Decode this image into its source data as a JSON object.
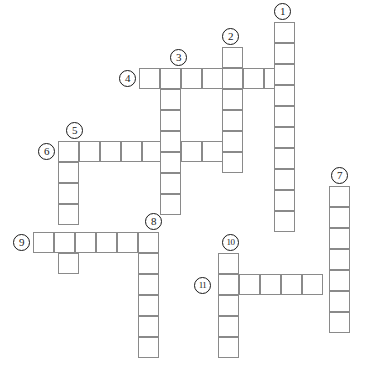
{
  "puzzle": {
    "type": "crossword-grid",
    "title": "",
    "cell_size": 21,
    "grid_origin": {
      "x": 33,
      "y": 22
    },
    "colors": {
      "cell_border": "#8a8a8a",
      "cell_fill": "#ffffff",
      "number_circle_border": "#1a1a1a",
      "number_text": "#1a1a1a",
      "background": "#ffffff"
    },
    "clue_numbers": [
      {
        "label": "1",
        "x": 274,
        "y": 3,
        "direction": "down",
        "length": 10
      },
      {
        "label": "2",
        "x": 222,
        "y": 28,
        "direction": "down",
        "length": 6
      },
      {
        "label": "3",
        "x": 170,
        "y": 49,
        "direction": "down",
        "length": 7
      },
      {
        "label": "4",
        "x": 119,
        "y": 70,
        "direction": "across",
        "length": 8
      },
      {
        "label": "5",
        "x": 66,
        "y": 122,
        "direction": "down",
        "length": 6
      },
      {
        "label": "6",
        "x": 38,
        "y": 143,
        "direction": "across",
        "length": 9
      },
      {
        "label": "7",
        "x": 331,
        "y": 167,
        "direction": "down",
        "length": 7
      },
      {
        "label": "8",
        "x": 145,
        "y": 213,
        "direction": "down",
        "length": 6
      },
      {
        "label": "9",
        "x": 13,
        "y": 234,
        "direction": "across",
        "length": 6
      },
      {
        "label": "10",
        "x": 222,
        "y": 234,
        "direction": "down",
        "length": 6
      },
      {
        "label": "11",
        "x": 194,
        "y": 277,
        "direction": "across",
        "length": 7
      }
    ],
    "entries": [
      {
        "number": "1",
        "direction": "down",
        "start_col": 12,
        "start_row": 0,
        "length": 10
      },
      {
        "number": "2",
        "direction": "down",
        "start_col": 9,
        "start_row": 1,
        "length": 6
      },
      {
        "number": "3",
        "direction": "down",
        "start_col": 7,
        "start_row": 2,
        "length": 7
      },
      {
        "number": "4",
        "direction": "across",
        "start_col": 5,
        "start_row": 2,
        "length": 8
      },
      {
        "number": "5",
        "direction": "down",
        "start_col": 2,
        "start_row": 5,
        "length": 6
      },
      {
        "number": "6",
        "direction": "across",
        "start_col": 2,
        "start_row": 5,
        "length": 9
      },
      {
        "number": "7",
        "direction": "down",
        "start_col": 15,
        "start_row": 7,
        "length": 7
      },
      {
        "number": "8",
        "direction": "down",
        "start_col": 6,
        "start_row": 10,
        "length": 6
      },
      {
        "number": "9",
        "direction": "across",
        "start_col": 1,
        "start_row": 10,
        "length": 6
      },
      {
        "number": "10",
        "direction": "down",
        "start_col": 10,
        "start_row": 11,
        "length": 6
      },
      {
        "number": "11",
        "direction": "across",
        "start_col": 10,
        "start_row": 13,
        "length": 7
      }
    ],
    "cells": [
      {
        "x": 274,
        "y": 22,
        "name": "cell-r0-c12"
      },
      {
        "x": 274,
        "y": 43,
        "name": "cell-r1-c12"
      },
      {
        "x": 222,
        "y": 47,
        "name": "cell-r1-c9"
      },
      {
        "x": 139,
        "y": 68,
        "name": "cell-r2-c5"
      },
      {
        "x": 160,
        "y": 68,
        "name": "cell-r2-c6"
      },
      {
        "x": 181,
        "y": 68,
        "name": "cell-r2-c7"
      },
      {
        "x": 202,
        "y": 68,
        "name": "cell-r2-c8"
      },
      {
        "x": 222,
        "y": 68,
        "name": "cell-r2-c9"
      },
      {
        "x": 243,
        "y": 68,
        "name": "cell-r2-c10"
      },
      {
        "x": 264,
        "y": 68,
        "name": "cell-r2-c11"
      },
      {
        "x": 274,
        "y": 64,
        "name": "cell-r2-c12"
      },
      {
        "x": 274,
        "y": 85,
        "name": "cell-r3-c12"
      },
      {
        "x": 222,
        "y": 89,
        "name": "cell-r3-c9"
      },
      {
        "x": 160,
        "y": 89,
        "name": "cell-r3-c6"
      },
      {
        "x": 274,
        "y": 106,
        "name": "cell-r4-c12"
      },
      {
        "x": 222,
        "y": 110,
        "name": "cell-r4-c9"
      },
      {
        "x": 160,
        "y": 110,
        "name": "cell-r4-c6"
      },
      {
        "x": 58,
        "y": 141,
        "name": "cell-r5-c2"
      },
      {
        "x": 79,
        "y": 141,
        "name": "cell-r5-c3"
      },
      {
        "x": 100,
        "y": 141,
        "name": "cell-r5-c4"
      },
      {
        "x": 121,
        "y": 141,
        "name": "cell-r5-c5"
      },
      {
        "x": 142,
        "y": 141,
        "name": "cell-r5-c6"
      },
      {
        "x": 160,
        "y": 131,
        "name": "cell-r5-c6b"
      },
      {
        "x": 181,
        "y": 141,
        "name": "cell-r5-c7"
      },
      {
        "x": 202,
        "y": 141,
        "name": "cell-r5-c8"
      },
      {
        "x": 222,
        "y": 131,
        "name": "cell-r5-c9"
      },
      {
        "x": 274,
        "y": 127,
        "name": "cell-r5-c12"
      },
      {
        "x": 58,
        "y": 162,
        "name": "cell-r6-c2"
      },
      {
        "x": 160,
        "y": 152,
        "name": "cell-r6-c6"
      },
      {
        "x": 222,
        "y": 152,
        "name": "cell-r6-c9"
      },
      {
        "x": 274,
        "y": 148,
        "name": "cell-r6-c12"
      },
      {
        "x": 58,
        "y": 183,
        "name": "cell-r7-c2"
      },
      {
        "x": 160,
        "y": 173,
        "name": "cell-r7-c6"
      },
      {
        "x": 274,
        "y": 169,
        "name": "cell-r7-c12"
      },
      {
        "x": 329,
        "y": 186,
        "name": "cell-r7-c15"
      },
      {
        "x": 58,
        "y": 204,
        "name": "cell-r8-c2"
      },
      {
        "x": 160,
        "y": 194,
        "name": "cell-r8-c6"
      },
      {
        "x": 274,
        "y": 190,
        "name": "cell-r8-c12"
      },
      {
        "x": 329,
        "y": 207,
        "name": "cell-r8-c15"
      },
      {
        "x": 274,
        "y": 211,
        "name": "cell-r9-c12"
      },
      {
        "x": 329,
        "y": 228,
        "name": "cell-r9-c15"
      },
      {
        "x": 33,
        "y": 232,
        "name": "cell-r10-c1"
      },
      {
        "x": 54,
        "y": 232,
        "name": "cell-r10-c2"
      },
      {
        "x": 75,
        "y": 232,
        "name": "cell-r10-c3"
      },
      {
        "x": 96,
        "y": 232,
        "name": "cell-r10-c4"
      },
      {
        "x": 117,
        "y": 232,
        "name": "cell-r10-c5"
      },
      {
        "x": 138,
        "y": 232,
        "name": "cell-r10-c6"
      },
      {
        "x": 329,
        "y": 249,
        "name": "cell-r10-c15"
      },
      {
        "x": 58,
        "y": 253,
        "name": "cell-r11-c2"
      },
      {
        "x": 138,
        "y": 253,
        "name": "cell-r11-c6"
      },
      {
        "x": 218,
        "y": 253,
        "name": "cell-r11-c10"
      },
      {
        "x": 329,
        "y": 270,
        "name": "cell-r11-c15"
      },
      {
        "x": 138,
        "y": 274,
        "name": "cell-r12-c6"
      },
      {
        "x": 218,
        "y": 274,
        "name": "cell-r12-c10"
      },
      {
        "x": 239,
        "y": 274,
        "name": "cell-r12-c11"
      },
      {
        "x": 260,
        "y": 274,
        "name": "cell-r12-c12"
      },
      {
        "x": 281,
        "y": 274,
        "name": "cell-r12-c13"
      },
      {
        "x": 302,
        "y": 274,
        "name": "cell-r12-c14"
      },
      {
        "x": 329,
        "y": 291,
        "name": "cell-r12-c15"
      },
      {
        "x": 138,
        "y": 295,
        "name": "cell-r13-c6"
      },
      {
        "x": 218,
        "y": 295,
        "name": "cell-r13-c10"
      },
      {
        "x": 329,
        "y": 312,
        "name": "cell-r13-c15"
      },
      {
        "x": 138,
        "y": 316,
        "name": "cell-r14-c6"
      },
      {
        "x": 218,
        "y": 316,
        "name": "cell-r14-c10"
      },
      {
        "x": 138,
        "y": 337,
        "name": "cell-r15-c6"
      },
      {
        "x": 218,
        "y": 337,
        "name": "cell-r15-c10"
      }
    ]
  }
}
